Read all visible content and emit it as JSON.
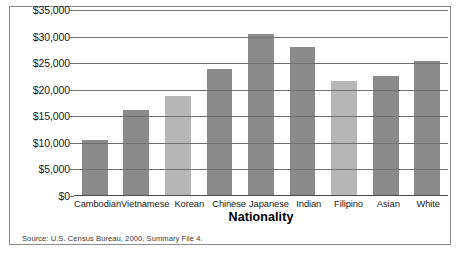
{
  "chart_data": {
    "type": "bar",
    "title": "",
    "xlabel": "Nationality",
    "ylabel": "",
    "categories": [
      "Cambodian",
      "Vietnamese",
      "Korean",
      "Chinese",
      "Japanese",
      "Indian",
      "Filipino",
      "Asian",
      "White"
    ],
    "values": [
      10500,
      16000,
      18800,
      23800,
      30400,
      28000,
      21500,
      22500,
      25300
    ],
    "ylim": [
      0,
      35000
    ],
    "ytick_values": [
      0,
      5000,
      10000,
      15000,
      20000,
      25000,
      30000,
      35000
    ],
    "ytick_labels": [
      "$0",
      "$5,000",
      "$10,000",
      "$15,000",
      "$20,000",
      "$25,000",
      "$30,000",
      "$35,000"
    ],
    "grid": true,
    "legend": "none",
    "bar_shades": [
      "dark",
      "dark",
      "light",
      "dark",
      "dark",
      "dark",
      "light",
      "dark",
      "dark"
    ],
    "colors": {
      "bar_dark": "#8a8a8a",
      "bar_light": "#b6b6b6",
      "gridline": "#6f6f6f",
      "axis": "#4a4a4a",
      "frame": "#8c8c8c",
      "text": "#1b1b1b",
      "background": "#ffffff"
    }
  },
  "footer": {
    "source": "Source: U.S. Census Bureau, 2000, Summary File 4."
  }
}
